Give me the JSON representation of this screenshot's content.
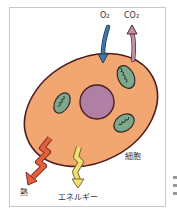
{
  "diagram": {
    "labels": {
      "o2": "O₂",
      "co2": "CO₂",
      "cell": "細胞",
      "heat": "熱",
      "energy": "エネルギー"
    },
    "colors": {
      "cell_fill": "#f2a772",
      "cell_outline": "#4a1e1e",
      "nucleus_fill": "#b07fa6",
      "mitochondria_fill": "#7fa88a",
      "o2_arrow": "#3f76a8",
      "co2_arrow": "#c98fa0",
      "heat_arrow": "#e3603e",
      "energy_arrow": "#f2df78",
      "frame_border": "#c8c8c8"
    }
  }
}
